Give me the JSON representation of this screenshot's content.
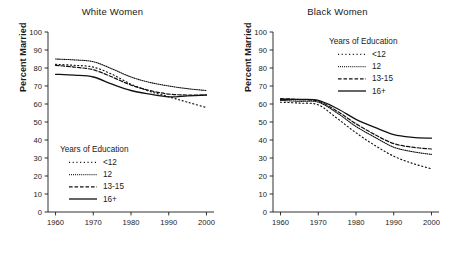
{
  "chart_data": [
    {
      "type": "line",
      "title": "White Women",
      "xlabel": "",
      "ylabel": "Percent Married",
      "x": [
        1960,
        1965,
        1970,
        1975,
        1980,
        1985,
        1990,
        1995,
        2000
      ],
      "xlim": [
        1958,
        2002
      ],
      "ylim": [
        0,
        100
      ],
      "yticks": [
        0,
        10,
        20,
        30,
        40,
        50,
        60,
        70,
        80,
        90,
        100
      ],
      "xticks": [
        1960,
        1970,
        1980,
        1990,
        2000
      ],
      "grid": false,
      "legend_title": "Years of Education",
      "legend_position": "lower-left-inside",
      "series": [
        {
          "name": "<12",
          "style": "loose-dotted",
          "values": [
            82.0,
            81.5,
            80.5,
            76.5,
            71.0,
            67.0,
            64.0,
            61.0,
            58.0
          ]
        },
        {
          "name": "12",
          "style": "fine-dotted",
          "values": [
            85.0,
            84.5,
            83.5,
            79.5,
            75.0,
            72.0,
            70.0,
            68.5,
            67.5
          ]
        },
        {
          "name": "13-15",
          "style": "dashed",
          "values": [
            81.5,
            80.5,
            79.0,
            75.0,
            70.5,
            67.5,
            65.5,
            65.0,
            65.0
          ]
        },
        {
          "name": "16+",
          "style": "solid",
          "values": [
            76.5,
            76.0,
            75.0,
            71.0,
            67.5,
            65.5,
            64.0,
            64.5,
            65.0
          ]
        }
      ]
    },
    {
      "type": "line",
      "title": "Black Women",
      "xlabel": "",
      "ylabel": "Percent Married",
      "x": [
        1960,
        1965,
        1970,
        1975,
        1980,
        1985,
        1990,
        1995,
        2000
      ],
      "xlim": [
        1958,
        2002
      ],
      "ylim": [
        0,
        100
      ],
      "yticks": [
        0,
        10,
        20,
        30,
        40,
        50,
        60,
        70,
        80,
        90,
        100
      ],
      "xticks": [
        1960,
        1970,
        1980,
        1990,
        2000
      ],
      "grid": false,
      "legend_title": "Years of Education",
      "legend_position": "upper-right-inside",
      "series": [
        {
          "name": "<12",
          "style": "loose-dotted",
          "values": [
            61.0,
            60.5,
            59.5,
            52.0,
            44.0,
            37.0,
            31.0,
            27.0,
            24.0
          ]
        },
        {
          "name": "12",
          "style": "fine-dotted",
          "values": [
            62.0,
            61.5,
            61.0,
            55.0,
            47.5,
            41.5,
            36.0,
            33.5,
            32.0
          ]
        },
        {
          "name": "13-15",
          "style": "dashed",
          "values": [
            63.0,
            62.5,
            61.5,
            56.0,
            49.0,
            43.0,
            38.0,
            36.0,
            35.0
          ]
        },
        {
          "name": "16+",
          "style": "solid",
          "values": [
            62.5,
            62.5,
            62.0,
            57.5,
            51.5,
            47.0,
            43.0,
            41.5,
            41.0
          ]
        }
      ]
    }
  ],
  "panels": [
    {
      "title": "White Women",
      "ylabel": "Percent Married",
      "yticks": [
        "100",
        "90",
        "80",
        "70",
        "60",
        "50",
        "40",
        "30",
        "20",
        "10",
        "0"
      ],
      "xticks": [
        "1960",
        "1970",
        "1980",
        "1990",
        "2000"
      ],
      "legend": {
        "title": "Years of Education",
        "items": [
          {
            "label": "<12"
          },
          {
            "label": "12"
          },
          {
            "label": "13-15"
          },
          {
            "label": "16+"
          }
        ]
      }
    },
    {
      "title": "Black Women",
      "ylabel": "Percent Married",
      "yticks": [
        "100",
        "90",
        "80",
        "70",
        "60",
        "50",
        "40",
        "30",
        "20",
        "10",
        "0"
      ],
      "xticks": [
        "1960",
        "1970",
        "1980",
        "1990",
        "2000"
      ],
      "legend": {
        "title": "Years of Education",
        "items": [
          {
            "label": "<12"
          },
          {
            "label": "12"
          },
          {
            "label": "13-15"
          },
          {
            "label": "16+"
          }
        ]
      }
    }
  ],
  "colors": {
    "ink": "#111111",
    "background": "#ffffff"
  }
}
